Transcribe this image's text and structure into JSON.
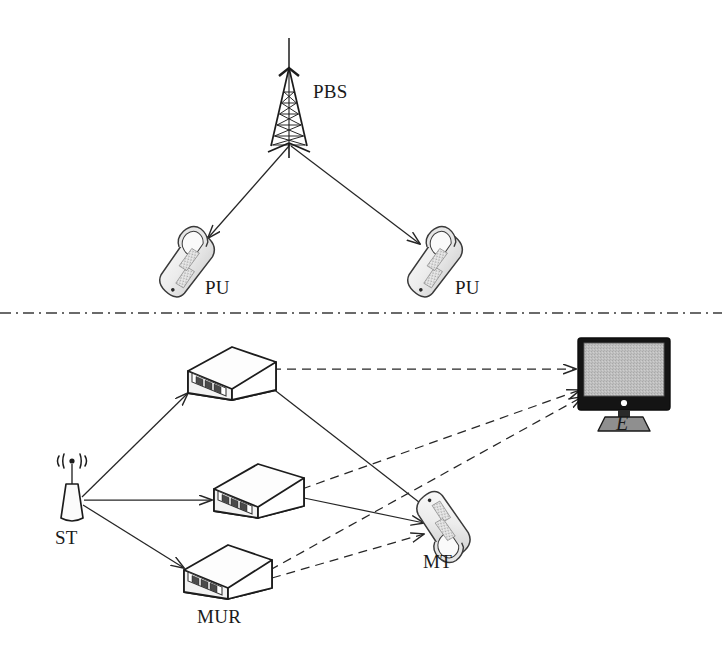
{
  "figure": {
    "type": "network-diagram",
    "width": 722,
    "height": 664,
    "background": "#ffffff"
  },
  "colors": {
    "stroke": "#262626",
    "label": "#1a1a1a",
    "device_fill": "#f0f0f0",
    "device_shade": "#d9d9d9",
    "screen_fill": "#bdbdbd",
    "bezel": "#1a1a1a",
    "separator": "#3a3a3a"
  },
  "labels": {
    "pbs": "PBS",
    "pu_left": "PU",
    "pu_right": "PU",
    "st": "ST",
    "mur": "MUR",
    "mt": "MT",
    "eavesdropper": "E"
  },
  "nodes": [
    {
      "id": "pbs",
      "label": "PBS",
      "icon": "tower-icon",
      "x": 289,
      "y": 100,
      "label_x": 313,
      "label_y": 91,
      "tier": "primary"
    },
    {
      "id": "pu_left",
      "label": "PU",
      "icon": "flip-phone-icon",
      "x": 188,
      "y": 265,
      "label_x": 205,
      "label_y": 287,
      "tier": "primary"
    },
    {
      "id": "pu_right",
      "label": "PU",
      "icon": "flip-phone-icon",
      "x": 436,
      "y": 265,
      "label_x": 455,
      "label_y": 287,
      "tier": "primary"
    },
    {
      "id": "st",
      "label": "ST",
      "icon": "antenna-icon",
      "x": 72,
      "y": 495,
      "label_x": 58,
      "label_y": 534,
      "tier": "secondary"
    },
    {
      "id": "relay_top",
      "label": "",
      "icon": "relay-box-icon",
      "x": 222,
      "y": 375,
      "tier": "secondary"
    },
    {
      "id": "relay_mid",
      "label": "",
      "icon": "relay-box-icon",
      "x": 250,
      "y": 491,
      "tier": "secondary"
    },
    {
      "id": "relay_bot",
      "label": "MUR",
      "icon": "relay-box-icon",
      "x": 218,
      "y": 572,
      "label_x": 199,
      "label_y": 613,
      "tier": "secondary"
    },
    {
      "id": "mt",
      "label": "MT",
      "icon": "flip-phone-icon",
      "x": 444,
      "y": 524,
      "label_x": 424,
      "label_y": 558,
      "tier": "secondary"
    },
    {
      "id": "eve",
      "label": "E",
      "icon": "monitor-icon",
      "x": 623,
      "y": 380,
      "label_x": 615,
      "label_y": 418,
      "tier": "eavesdropper"
    }
  ],
  "edges": [
    {
      "from": "pbs",
      "to": "pu_left",
      "style": "solid",
      "arrow": true
    },
    {
      "from": "pbs",
      "to": "pu_right",
      "style": "solid",
      "arrow": true
    },
    {
      "from": "st",
      "to": "relay_top",
      "style": "solid",
      "arrow": true
    },
    {
      "from": "st",
      "to": "relay_mid",
      "style": "solid",
      "arrow": true
    },
    {
      "from": "st",
      "to": "relay_bot",
      "style": "solid",
      "arrow": true
    },
    {
      "from": "relay_top",
      "to": "mt",
      "style": "solid",
      "arrow": true
    },
    {
      "from": "relay_mid",
      "to": "mt",
      "style": "solid",
      "arrow": true
    },
    {
      "from": "relay_bot",
      "to": "mt",
      "style": "dashed",
      "arrow": true
    },
    {
      "from": "relay_top",
      "to": "eve",
      "style": "dashed",
      "arrow": true
    },
    {
      "from": "relay_mid",
      "to": "eve",
      "style": "dashed",
      "arrow": true
    },
    {
      "from": "relay_bot",
      "to": "eve",
      "style": "dashed",
      "arrow": true
    }
  ],
  "separator": {
    "name": "tier-separator",
    "style": "dash-dot",
    "y": 313,
    "x_start": 0,
    "x_end": 722
  }
}
